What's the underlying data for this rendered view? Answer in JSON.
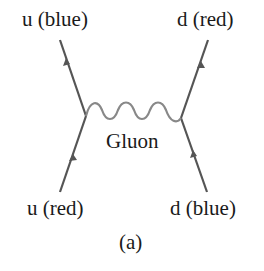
{
  "diagram": {
    "type": "feynman-diagram",
    "caption": "(a)",
    "colors": {
      "line": "#555555",
      "gluon": "#888888",
      "text": "#1a1a1a",
      "background": "#ffffff"
    },
    "particles": {
      "top_left": {
        "label": "u (blue)",
        "role": "outgoing quark"
      },
      "top_right": {
        "label": "d (red)",
        "role": "outgoing quark"
      },
      "bottom_left": {
        "label": "u (red)",
        "role": "incoming quark"
      },
      "bottom_right": {
        "label": "d (blue)",
        "role": "incoming quark"
      }
    },
    "exchange": {
      "label": "Gluon",
      "style": "wavy"
    },
    "vertices": [
      {
        "name": "left-vertex",
        "x": 86,
        "y": 116
      },
      {
        "name": "right-vertex",
        "x": 181,
        "y": 118
      }
    ],
    "edges": [
      {
        "from": "bottom_left",
        "to": "left-vertex",
        "arrow": "toward vertex"
      },
      {
        "from": "left-vertex",
        "to": "top_left",
        "arrow": "away from vertex"
      },
      {
        "from": "bottom_right",
        "to": "right-vertex",
        "arrow": "toward vertex"
      },
      {
        "from": "right-vertex",
        "to": "top_right",
        "arrow": "away from vertex"
      },
      {
        "from": "left-vertex",
        "to": "right-vertex",
        "type": "gluon"
      }
    ]
  }
}
